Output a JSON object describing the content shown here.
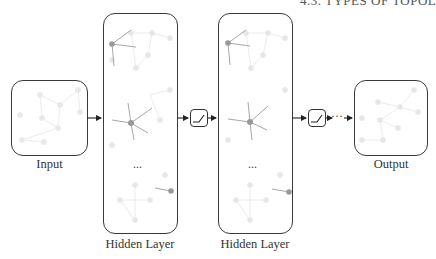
{
  "header": {
    "text": "4.3. TYPES OF TOPOL"
  },
  "nodes": {
    "input": {
      "label": "Input"
    },
    "hidden1": {
      "label": "Hidden Layer",
      "ellipsis": "..."
    },
    "hidden2": {
      "label": "Hidden Layer",
      "ellipsis": "..."
    },
    "output": {
      "label": "Output"
    }
  },
  "activation": {
    "icon": "relu-activation-icon"
  },
  "continuation": {
    "text": "···"
  },
  "colors": {
    "stroke": "#3a3a3a",
    "graph_faint": "#e6e6e6",
    "graph_highlight": "#999999"
  }
}
